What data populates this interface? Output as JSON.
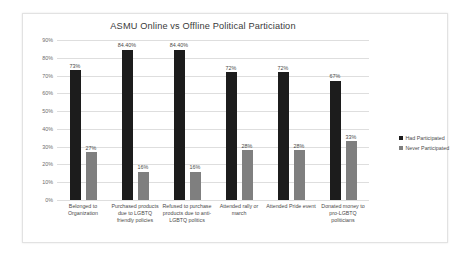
{
  "chart_data": {
    "type": "bar",
    "title": "ASMU Online vs Offline Political Particiation",
    "xlabel": "",
    "ylabel": "",
    "ylim": [
      0,
      90
    ],
    "grid": true,
    "legend_position": "right",
    "categories": [
      "Belonged to Organization",
      "Purchased products due to LGBTQ friendly policies",
      "Refused to purchase products due to anti-LGBTQ politics",
      "Attended rally or march",
      "Attended Pride event",
      "Donated money to pro-LGBTQ politicians"
    ],
    "ytick_labels": [
      "0%",
      "10%",
      "20%",
      "30%",
      "40%",
      "50%",
      "60%",
      "70%",
      "80%",
      "90%"
    ],
    "ytick_values": [
      0,
      10,
      20,
      30,
      40,
      50,
      60,
      70,
      80,
      90
    ],
    "series": [
      {
        "name": "Had Participated",
        "color": "#1c1c1c",
        "values": [
          73,
          84.4,
          84.4,
          72,
          72,
          67
        ],
        "labels": [
          "73%",
          "84.40%",
          "84.40%",
          "72%",
          "72%",
          "67%"
        ]
      },
      {
        "name": "Never Participated",
        "color": "#7f7f7f",
        "values": [
          27,
          16,
          16,
          28,
          28,
          33
        ],
        "labels": [
          "27%",
          "16%",
          "16%",
          "28%",
          "28%",
          "33%"
        ]
      }
    ]
  },
  "legend": {
    "items": [
      {
        "label": "Had Participated",
        "color": "#1c1c1c"
      },
      {
        "label": "Never Participated",
        "color": "#7f7f7f"
      }
    ]
  }
}
